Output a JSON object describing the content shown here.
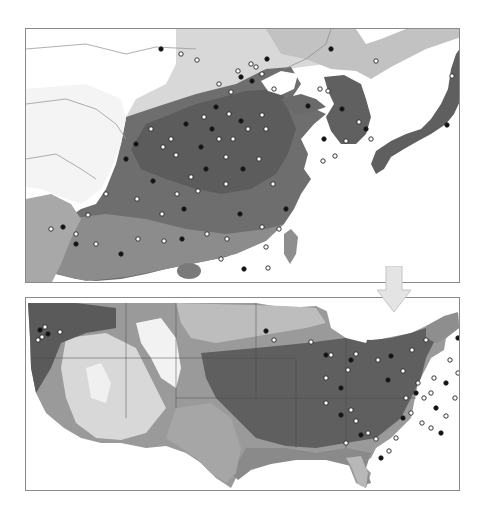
{
  "figure": {
    "panels": [
      {
        "id": "asia",
        "label": "",
        "region": "East Asia (China, Korea, Japan)"
      },
      {
        "id": "usa",
        "label": "",
        "region": "Contiguous United States"
      }
    ],
    "arrow": {
      "direction": "down",
      "color": "#e4e4e4",
      "stroke": "#c8c8c8"
    },
    "colors": {
      "frame": "#8a8a8a",
      "land_light": "#d6d6d6",
      "land_mid": "#a9a9a9",
      "land_dark": "#6f6f6f",
      "land_darkest": "#555555",
      "border_line": "#9a9a9a",
      "marker_open_fill": "#ffffff",
      "marker_filled": "#111111"
    },
    "asia_markers": [
      [
        135,
        20
      ],
      [
        171,
        31
      ],
      [
        212,
        42
      ],
      [
        241,
        30
      ],
      [
        225,
        35
      ],
      [
        230,
        38
      ],
      [
        215,
        48
      ],
      [
        193,
        55
      ],
      [
        205,
        63
      ],
      [
        226,
        52
      ],
      [
        236,
        45
      ],
      [
        248,
        60
      ],
      [
        190,
        78
      ],
      [
        178,
        88
      ],
      [
        203,
        85
      ],
      [
        215,
        92
      ],
      [
        236,
        86
      ],
      [
        222,
        100
      ],
      [
        160,
        95
      ],
      [
        145,
        110
      ],
      [
        125,
        100
      ],
      [
        110,
        115
      ],
      [
        137,
        118
      ],
      [
        150,
        126
      ],
      [
        175,
        118
      ],
      [
        193,
        110
      ],
      [
        200,
        128
      ],
      [
        180,
        140
      ],
      [
        165,
        148
      ],
      [
        151,
        165
      ],
      [
        127,
        152
      ],
      [
        111,
        170
      ],
      [
        136,
        185
      ],
      [
        158,
        180
      ],
      [
        172,
        162
      ],
      [
        200,
        155
      ],
      [
        217,
        140
      ],
      [
        233,
        130
      ],
      [
        247,
        155
      ],
      [
        260,
        180
      ],
      [
        253,
        200
      ],
      [
        236,
        198
      ],
      [
        214,
        185
      ],
      [
        201,
        210
      ],
      [
        181,
        205
      ],
      [
        156,
        210
      ],
      [
        138,
        212
      ],
      [
        112,
        210
      ],
      [
        95,
        225
      ],
      [
        70,
        215
      ],
      [
        50,
        205
      ],
      [
        37,
        198
      ],
      [
        25,
        200
      ],
      [
        240,
        218
      ],
      [
        218,
        240
      ],
      [
        195,
        230
      ],
      [
        120,
        262
      ],
      [
        282,
        77
      ],
      [
        294,
        60
      ],
      [
        302,
        62
      ],
      [
        316,
        80
      ],
      [
        320,
        112
      ],
      [
        333,
        93
      ],
      [
        340,
        100
      ],
      [
        345,
        110
      ],
      [
        309,
        127
      ],
      [
        298,
        110
      ],
      [
        297,
        132
      ],
      [
        350,
        32
      ],
      [
        421,
        96
      ],
      [
        426,
        47
      ],
      [
        437,
        44
      ],
      [
        305,
        20
      ],
      [
        155,
        25
      ],
      [
        242,
        239
      ],
      [
        186,
        100
      ],
      [
        207,
        110
      ],
      [
        240,
        100
      ],
      [
        100,
        130
      ],
      [
        80,
        165
      ],
      [
        62,
        186
      ],
      [
        50,
        215
      ]
    ],
    "usa_markers": [
      [
        14,
        32
      ],
      [
        19,
        29
      ],
      [
        16,
        39
      ],
      [
        22,
        36
      ],
      [
        12,
        42
      ],
      [
        34,
        34
      ],
      [
        240,
        33
      ],
      [
        248,
        42
      ],
      [
        285,
        44
      ],
      [
        300,
        57
      ],
      [
        305,
        57
      ],
      [
        330,
        56
      ],
      [
        325,
        62
      ],
      [
        322,
        72
      ],
      [
        300,
        80
      ],
      [
        315,
        90
      ],
      [
        300,
        105
      ],
      [
        325,
        112
      ],
      [
        315,
        117
      ],
      [
        330,
        123
      ],
      [
        320,
        145
      ],
      [
        335,
        137
      ],
      [
        342,
        135
      ],
      [
        350,
        141
      ],
      [
        355,
        160
      ],
      [
        363,
        153
      ],
      [
        370,
        140
      ],
      [
        377,
        120
      ],
      [
        385,
        115
      ],
      [
        380,
        100
      ],
      [
        390,
        95
      ],
      [
        398,
        100
      ],
      [
        405,
        95
      ],
      [
        410,
        110
      ],
      [
        396,
        125
      ],
      [
        405,
        130
      ],
      [
        415,
        135
      ],
      [
        420,
        118
      ],
      [
        429,
        100
      ],
      [
        437,
        90
      ],
      [
        442,
        75
      ],
      [
        424,
        62
      ],
      [
        432,
        40
      ],
      [
        400,
        42
      ],
      [
        386,
        52
      ],
      [
        365,
        58
      ],
      [
        352,
        62
      ],
      [
        377,
        73
      ],
      [
        362,
        82
      ],
      [
        392,
        85
      ],
      [
        408,
        80
      ],
      [
        420,
        85
      ],
      [
        432,
        75
      ]
    ]
  }
}
